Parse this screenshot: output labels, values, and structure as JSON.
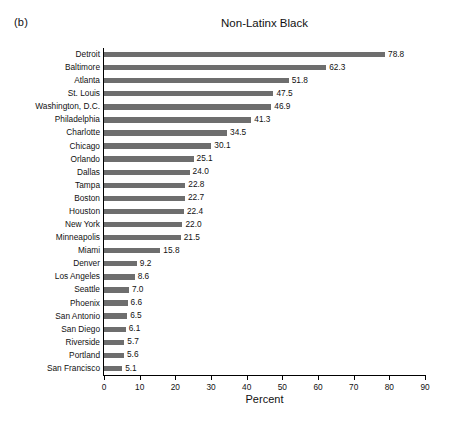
{
  "panel": {
    "label": "(b)"
  },
  "chart_data": {
    "type": "bar",
    "orientation": "horizontal",
    "title": "Non-Latinx Black",
    "xlabel": "Percent",
    "ylabel": "",
    "xlim": [
      0,
      90
    ],
    "xticks": [
      0,
      10,
      20,
      30,
      40,
      50,
      60,
      70,
      80,
      90
    ],
    "grid": false,
    "legend": null,
    "bar_color": "#6e6e6e",
    "value_label_format": "one-decimal",
    "categories": [
      "Detroit",
      "Baltimore",
      "Atlanta",
      "St. Louis",
      "Washington, D.C.",
      "Philadelphia",
      "Charlotte",
      "Chicago",
      "Orlando",
      "Dallas",
      "Tampa",
      "Boston",
      "Houston",
      "New York",
      "Minneapolis",
      "Miami",
      "Denver",
      "Los Angeles",
      "Seattle",
      "Phoenix",
      "San Antonio",
      "San Diego",
      "Riverside",
      "Portland",
      "San Francisco"
    ],
    "values": [
      78.8,
      62.3,
      51.8,
      47.5,
      46.9,
      41.3,
      34.5,
      30.1,
      25.1,
      24.0,
      22.8,
      22.7,
      22.4,
      22.0,
      21.5,
      15.8,
      9.2,
      8.6,
      7.0,
      6.6,
      6.5,
      6.1,
      5.7,
      5.6,
      5.1
    ],
    "value_labels": [
      "78.8",
      "62.3",
      "51.8",
      "47.5",
      "46.9",
      "41.3",
      "34.5",
      "30.1",
      "25.1",
      "24.0",
      "22.8",
      "22.7",
      "22.4",
      "22.0",
      "21.5",
      "15.8",
      "9.2",
      "8.6",
      "7.0",
      "6.6",
      "6.5",
      "6.1",
      "5.7",
      "5.6",
      "5.1"
    ]
  }
}
